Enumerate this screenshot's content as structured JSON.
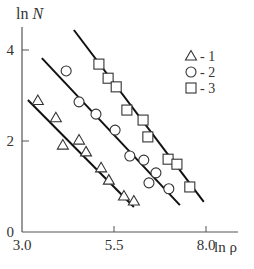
{
  "chart_data": {
    "type": "scatter",
    "title": "",
    "xlabel": "ln ρ",
    "ylabel": "ln N",
    "xlim": [
      3.0,
      8.9
    ],
    "ylim": [
      0,
      4.7
    ],
    "x_ticks": [
      "3.0",
      "5.5",
      "8.0"
    ],
    "y_ticks": [
      "0",
      "2",
      "4"
    ],
    "grid": false,
    "legend_position": "upper right",
    "series": [
      {
        "name": "1",
        "marker": "triangle",
        "points": [
          [
            3.43,
            2.89
          ],
          [
            3.92,
            2.51
          ],
          [
            4.11,
            1.91
          ],
          [
            4.55,
            2.02
          ],
          [
            4.74,
            1.76
          ],
          [
            5.15,
            1.41
          ],
          [
            5.36,
            1.14
          ],
          [
            5.77,
            0.79
          ],
          [
            6.04,
            0.68
          ]
        ],
        "fit_line": [
          [
            3.16,
            2.9
          ],
          [
            6.04,
            0.55
          ]
        ]
      },
      {
        "name": "2",
        "marker": "circle",
        "points": [
          [
            4.2,
            3.54
          ],
          [
            4.55,
            2.86
          ],
          [
            5.01,
            2.59
          ],
          [
            5.53,
            2.24
          ],
          [
            5.93,
            1.67
          ],
          [
            6.31,
            1.58
          ],
          [
            6.64,
            1.3
          ],
          [
            6.45,
            1.08
          ],
          [
            6.99,
            0.95
          ]
        ],
        "fit_line": [
          [
            3.54,
            3.82
          ],
          [
            7.29,
            0.59
          ]
        ]
      },
      {
        "name": "3",
        "marker": "square",
        "points": [
          [
            5.09,
            3.69
          ],
          [
            5.34,
            3.38
          ],
          [
            5.56,
            3.19
          ],
          [
            5.85,
            2.68
          ],
          [
            6.29,
            2.46
          ],
          [
            6.42,
            2.09
          ],
          [
            6.97,
            1.6
          ],
          [
            7.21,
            1.49
          ],
          [
            7.56,
            0.99
          ]
        ],
        "fit_line": [
          [
            4.41,
            4.44
          ],
          [
            7.94,
            0.66
          ]
        ]
      }
    ],
    "legend": [
      {
        "marker": "triangle",
        "label": "- 1"
      },
      {
        "marker": "circle",
        "label": "- 2"
      },
      {
        "marker": "square",
        "label": "- 3"
      }
    ]
  },
  "labels": {
    "y_axis": "ln N",
    "x_axis": "ln ρ"
  }
}
